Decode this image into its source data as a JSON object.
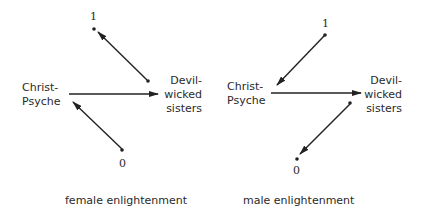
{
  "panels": [
    {
      "caption": "female enlightenment",
      "left_node": [
        "Christ-",
        "Psyche"
      ],
      "right_node": [
        "Devil-",
        "wicked",
        "sisters"
      ],
      "top_value": "1",
      "bottom_value": "0",
      "edges": [
        {
          "from": "Christ-Psyche",
          "to": "Devil-wicked sisters"
        },
        {
          "from": "Devil-wicked sisters",
          "to": "1"
        },
        {
          "from": "0",
          "to": "Christ-Psyche"
        }
      ]
    },
    {
      "caption": "male enlightenment",
      "left_node": [
        "Christ-",
        "Psyche"
      ],
      "right_node": [
        "Devil-",
        "wicked",
        "sisters"
      ],
      "top_value": "1",
      "bottom_value": "0",
      "edges": [
        {
          "from": "Christ-Psyche",
          "to": "Devil-wicked sisters"
        },
        {
          "from": "1",
          "to": "Christ-Psyche"
        },
        {
          "from": "Devil-wicked sisters",
          "to": "0"
        }
      ]
    }
  ],
  "colors": {
    "ink": "#222222",
    "background": "#ffffff"
  }
}
